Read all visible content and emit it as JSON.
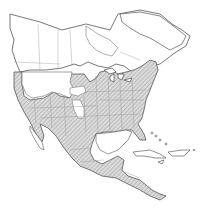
{
  "map": {
    "title": "Range map",
    "region": "North America",
    "legend": [
      {
        "label": "Range (hatched)",
        "pattern": "diagonal-hatch",
        "color": "#cfcfcf"
      },
      {
        "label": "Outside range",
        "pattern": "none",
        "color": "#ffffff"
      }
    ],
    "colors": {
      "outline": "#555555",
      "boundary": "#9a9a9a",
      "range_fill": "#d6d6d6",
      "hatch": "#8a8a8a",
      "background": "#ffffff"
    }
  }
}
